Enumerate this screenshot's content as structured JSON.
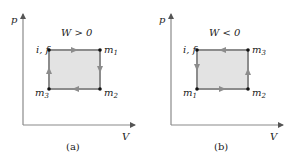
{
  "panels": [
    {
      "caption": "(a)",
      "work_label": "W > 0",
      "y_axis_label": "p",
      "x_axis_label": "V",
      "corners": {
        "top_left": {
          "name": "i, f"
        },
        "top_right": {
          "name": "m",
          "sub": "1"
        },
        "bottom_right": {
          "name": "m",
          "sub": "2"
        },
        "bottom_left": {
          "name": "m",
          "sub": "3"
        }
      },
      "direction": "clockwise"
    },
    {
      "caption": "(b)",
      "work_label": "W < 0",
      "y_axis_label": "p",
      "x_axis_label": "V",
      "corners": {
        "top_left": {
          "name": "i, f"
        },
        "top_right": {
          "name": "m",
          "sub": "3"
        },
        "bottom_right": {
          "name": "m",
          "sub": "2"
        },
        "bottom_left": {
          "name": "m",
          "sub": "1"
        }
      },
      "direction": "counterclockwise"
    }
  ],
  "colors": {
    "axis": "#8a8a8a",
    "path": "#8c8c8c",
    "fill": "#e3e3e3",
    "point": "#111111",
    "text": "#222222"
  }
}
